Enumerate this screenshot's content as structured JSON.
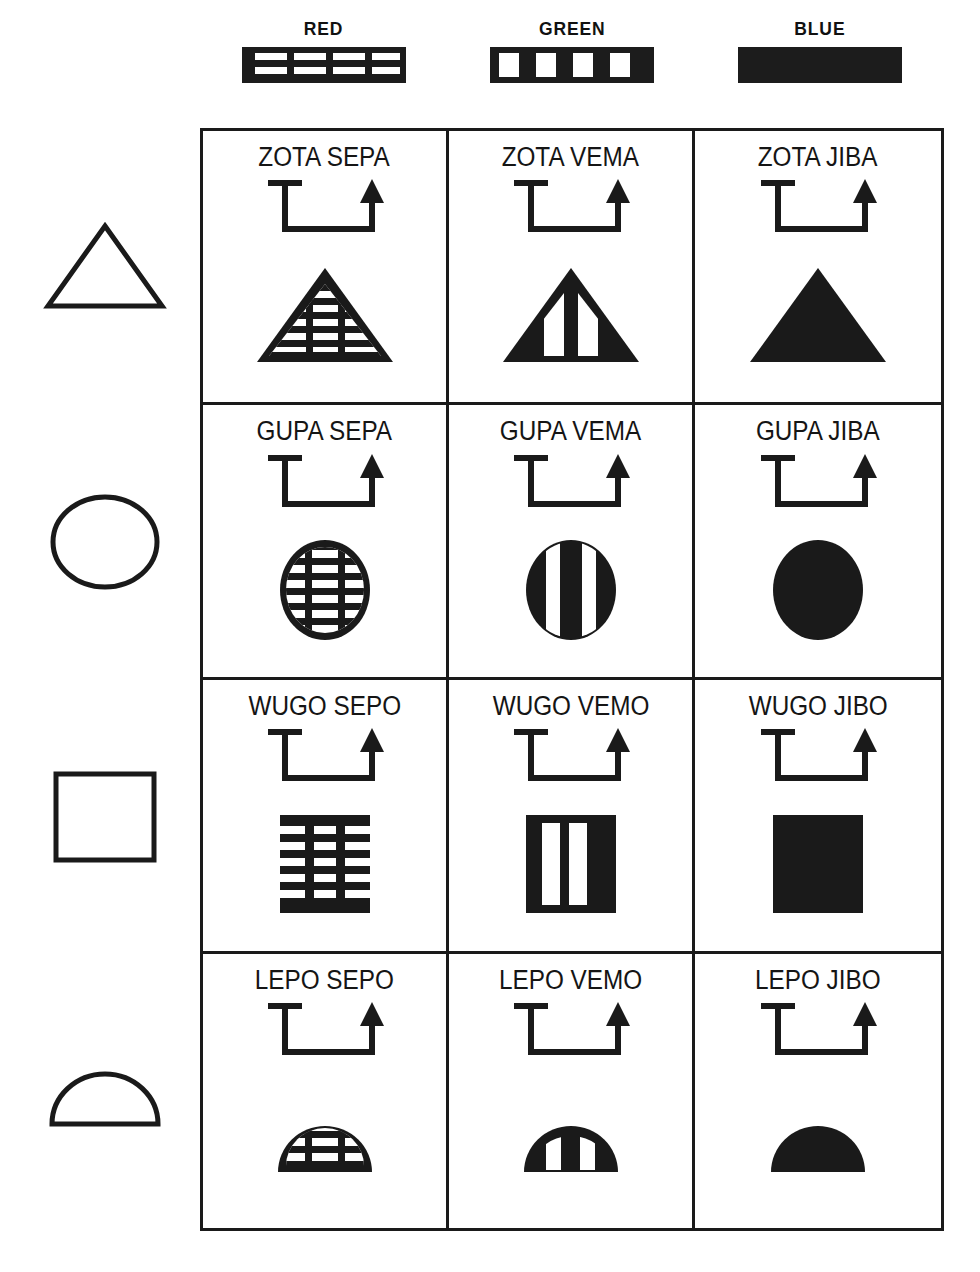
{
  "columns": [
    {
      "label": "RED",
      "swatch": "horizontal-dashed-stripes",
      "fill": "hstripe"
    },
    {
      "label": "GREEN",
      "swatch": "vertical-bars",
      "fill": "vstripe"
    },
    {
      "label": "BLUE",
      "swatch": "solid-black",
      "fill": "solid"
    }
  ],
  "row_shapes": [
    {
      "name": "triangle",
      "icon": "triangle-outline-icon"
    },
    {
      "name": "circle",
      "icon": "circle-outline-icon"
    },
    {
      "name": "square",
      "icon": "square-outline-icon"
    },
    {
      "name": "half-circle",
      "icon": "half-circle-outline-icon"
    }
  ],
  "rows": [
    {
      "shape": "triangle",
      "cells": [
        {
          "label": "ZOTA SEPA",
          "word1": "ZOTA",
          "word2": "SEPA",
          "fill": "hstripe",
          "connector": "bracket-arrow"
        },
        {
          "label": "ZOTA VEMA",
          "word1": "ZOTA",
          "word2": "VEMA",
          "fill": "vstripe",
          "connector": "bracket-arrow"
        },
        {
          "label": "ZOTA JIBA",
          "word1": "ZOTA",
          "word2": "JIBA",
          "fill": "solid",
          "connector": "bracket-arrow"
        }
      ]
    },
    {
      "shape": "circle",
      "cells": [
        {
          "label": "GUPA SEPA",
          "word1": "GUPA",
          "word2": "SEPA",
          "fill": "hstripe",
          "connector": "bracket-arrow"
        },
        {
          "label": "GUPA VEMA",
          "word1": "GUPA",
          "word2": "VEMA",
          "fill": "vstripe",
          "connector": "bracket-arrow"
        },
        {
          "label": "GUPA JIBA",
          "word1": "GUPA",
          "word2": "JIBA",
          "fill": "solid",
          "connector": "bracket-arrow"
        }
      ]
    },
    {
      "shape": "square",
      "cells": [
        {
          "label": "WUGO SEPO",
          "word1": "WUGO",
          "word2": "SEPO",
          "fill": "hstripe",
          "connector": "bracket-arrow"
        },
        {
          "label": "WUGO VEMO",
          "word1": "WUGO",
          "word2": "VEMO",
          "fill": "vstripe",
          "connector": "bracket-arrow"
        },
        {
          "label": "WUGO JIBO",
          "word1": "WUGO",
          "word2": "JIBO",
          "fill": "solid",
          "connector": "bracket-arrow"
        }
      ]
    },
    {
      "shape": "half-circle",
      "cells": [
        {
          "label": "LEPO SEPO",
          "word1": "LEPO",
          "word2": "SEPO",
          "fill": "hstripe",
          "connector": "bracket-arrow"
        },
        {
          "label": "LEPO VEMO",
          "word1": "LEPO",
          "word2": "VEMO",
          "fill": "vstripe",
          "connector": "bracket-arrow"
        },
        {
          "label": "LEPO JIBO",
          "word1": "LEPO",
          "word2": "JIBO",
          "fill": "solid",
          "connector": "bracket-arrow"
        }
      ]
    }
  ],
  "colors": {
    "ink": "#1a1a1a",
    "paper": "#ffffff"
  }
}
